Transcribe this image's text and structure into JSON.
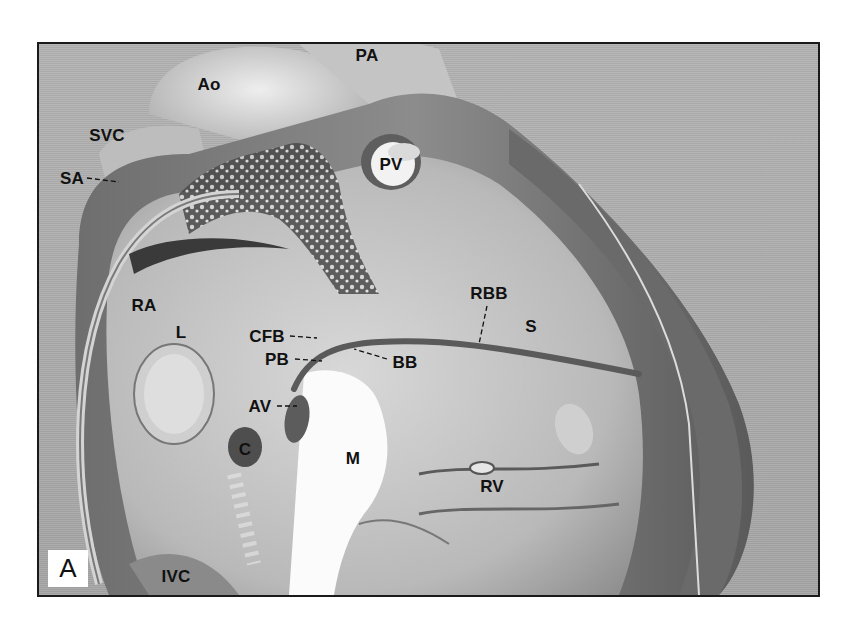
{
  "figure": {
    "panel_label": "A",
    "labels": [
      {
        "id": "ao",
        "text": "Ao",
        "x": 170,
        "y": 40
      },
      {
        "id": "pa",
        "text": "PA",
        "x": 328,
        "y": 11
      },
      {
        "id": "svc",
        "text": "SVC",
        "x": 68,
        "y": 91
      },
      {
        "id": "sa",
        "text": "SA",
        "x": 33,
        "y": 134
      },
      {
        "id": "pv",
        "text": "PV",
        "x": 352,
        "y": 120
      },
      {
        "id": "ra",
        "text": "RA",
        "x": 105,
        "y": 261
      },
      {
        "id": "l",
        "text": "L",
        "x": 142,
        "y": 288
      },
      {
        "id": "cfb",
        "text": "CFB",
        "x": 228,
        "y": 292
      },
      {
        "id": "pb",
        "text": "PB",
        "x": 238,
        "y": 315
      },
      {
        "id": "bb",
        "text": "BB",
        "x": 366,
        "y": 318
      },
      {
        "id": "av",
        "text": "AV",
        "x": 221,
        "y": 362
      },
      {
        "id": "c",
        "text": "C",
        "x": 206,
        "y": 405
      },
      {
        "id": "m",
        "text": "M",
        "x": 314,
        "y": 414
      },
      {
        "id": "rbb",
        "text": "RBB",
        "x": 450,
        "y": 249
      },
      {
        "id": "s",
        "text": "S",
        "x": 492,
        "y": 282
      },
      {
        "id": "rv",
        "text": "RV",
        "x": 453,
        "y": 442
      },
      {
        "id": "ivc",
        "text": "IVC",
        "x": 137,
        "y": 532
      }
    ]
  }
}
